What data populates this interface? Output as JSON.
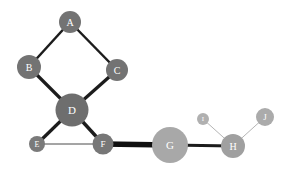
{
  "figure": {
    "type": "node-link-graph",
    "background_color": "#ffffff",
    "width": 292,
    "height": 172
  },
  "chart_data": {
    "type": "network",
    "title": "",
    "xlabel": "",
    "ylabel": "",
    "grid": false,
    "legend": "none",
    "node_count": 10,
    "edge_count": 11,
    "nodes": [
      {
        "id": "A",
        "label": "A",
        "x": 70,
        "y": 22,
        "r": 11,
        "color": "#737373",
        "text_color": "#ffffff",
        "font_size": 10
      },
      {
        "id": "B",
        "label": "B",
        "x": 29,
        "y": 67,
        "r": 12,
        "color": "#737373",
        "text_color": "#ffffff",
        "font_size": 10
      },
      {
        "id": "C",
        "label": "C",
        "x": 117,
        "y": 70,
        "r": 11,
        "color": "#737373",
        "text_color": "#ffffff",
        "font_size": 10
      },
      {
        "id": "D",
        "label": "D",
        "x": 72,
        "y": 110,
        "r": 16.5,
        "color": "#6e6e6e",
        "text_color": "#ffffff",
        "font_size": 11
      },
      {
        "id": "E",
        "label": "E",
        "x": 37,
        "y": 144,
        "r": 8,
        "color": "#7a7a7a",
        "text_color": "#ffffff",
        "font_size": 8
      },
      {
        "id": "F",
        "label": "F",
        "x": 103,
        "y": 144,
        "r": 10.5,
        "color": "#777777",
        "text_color": "#ffffff",
        "font_size": 9
      },
      {
        "id": "G",
        "label": "G",
        "x": 170,
        "y": 145,
        "r": 18,
        "color": "#a8a8a8",
        "text_color": "#ffffff",
        "font_size": 11
      },
      {
        "id": "H",
        "label": "H",
        "x": 233,
        "y": 146,
        "r": 12,
        "color": "#a0a0a0",
        "text_color": "#ffffff",
        "font_size": 10
      },
      {
        "id": "I",
        "label": "I",
        "x": 203,
        "y": 119,
        "r": 6,
        "color": "#b0b0b0",
        "text_color": "#ffffff",
        "font_size": 7
      },
      {
        "id": "J",
        "label": "J",
        "x": 265,
        "y": 117,
        "r": 9,
        "color": "#ababab",
        "text_color": "#ffffff",
        "font_size": 9
      }
    ],
    "edges": [
      {
        "source": "A",
        "target": "B",
        "weight": 2.5,
        "color": "#1c1c1c"
      },
      {
        "source": "A",
        "target": "C",
        "weight": 2.5,
        "color": "#1c1c1c"
      },
      {
        "source": "B",
        "target": "D",
        "weight": 3.2,
        "color": "#1c1c1c"
      },
      {
        "source": "C",
        "target": "D",
        "weight": 3.2,
        "color": "#1c1c1c"
      },
      {
        "source": "D",
        "target": "E",
        "weight": 3.2,
        "color": "#1c1c1c"
      },
      {
        "source": "D",
        "target": "F",
        "weight": 3.4,
        "color": "#1c1c1c"
      },
      {
        "source": "E",
        "target": "F",
        "weight": 1.0,
        "color": "#4a4a4a"
      },
      {
        "source": "F",
        "target": "G",
        "weight": 5.5,
        "color": "#101010"
      },
      {
        "source": "G",
        "target": "H",
        "weight": 3.2,
        "color": "#1c1c1c"
      },
      {
        "source": "I",
        "target": "H",
        "weight": 1.0,
        "color": "#b5b5b5"
      },
      {
        "source": "J",
        "target": "H",
        "weight": 1.0,
        "color": "#b5b5b5"
      }
    ]
  }
}
